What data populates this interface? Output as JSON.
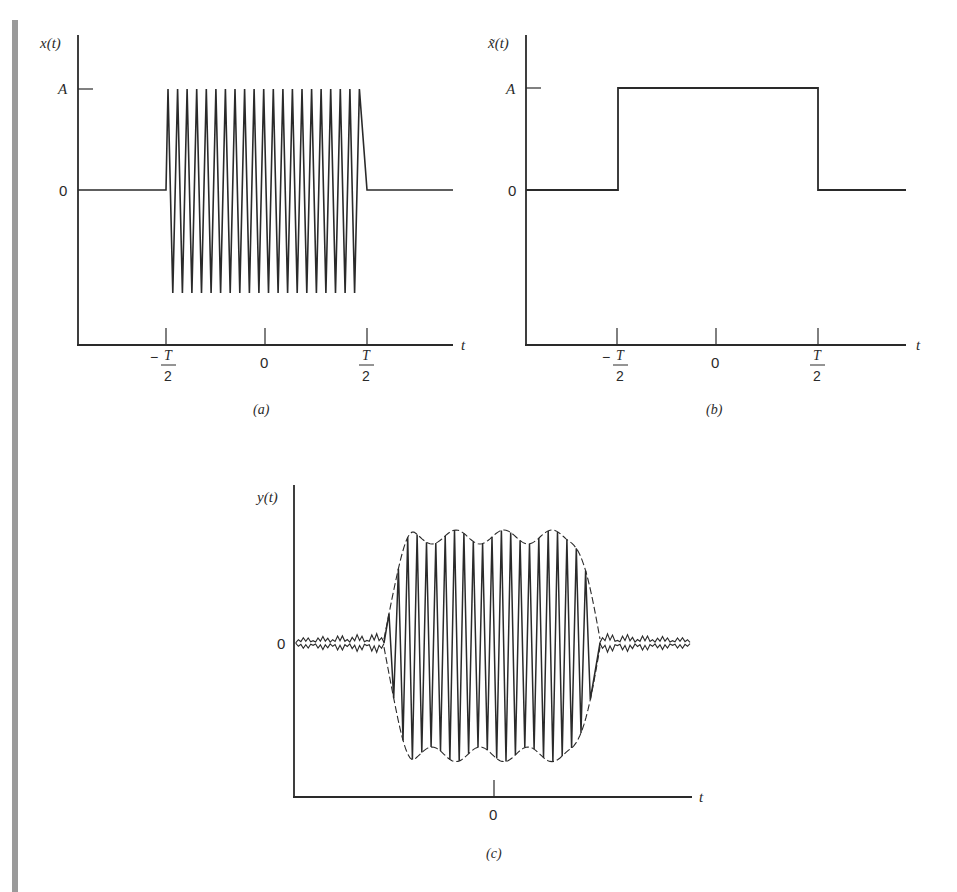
{
  "figure": {
    "margin_bar_color": "#9a9a9a",
    "ink_color": "#2a2a2a",
    "panels": {
      "a": {
        "caption": "(a)",
        "ylabel": "x(t)",
        "xlabel": "t",
        "ytick_top": "A",
        "ytick_zero": "0",
        "xticks": [
          "−T/2",
          "0",
          "T/2"
        ]
      },
      "b": {
        "caption": "(b)",
        "ylabel": "x̃(t)",
        "xlabel": "t",
        "ytick_top": "A",
        "ytick_zero": "0",
        "xticks": [
          "−T/2",
          "0",
          "T/2"
        ]
      },
      "c": {
        "caption": "(c)",
        "ylabel": "y(t)",
        "xlabel": "t",
        "ytick_zero": "0",
        "xticks": [
          "0"
        ]
      }
    }
  },
  "chart_data": [
    {
      "id": "a",
      "type": "line",
      "title": "(a)",
      "xlabel": "t",
      "ylabel": "x(t)",
      "description": "Sinusoidal pulse: oscillation of amplitude A between t = -T/2 and t = T/2, zero elsewhere",
      "x_tick_labels": [
        "-T/2",
        "0",
        "T/2"
      ],
      "y_tick_labels": [
        "0",
        "A"
      ],
      "oscillation_cycles_visible": 21,
      "amplitude": "A",
      "support": [
        "-T/2",
        "T/2"
      ],
      "grid": false
    },
    {
      "id": "b",
      "type": "line",
      "title": "(b)",
      "xlabel": "t",
      "ylabel": "x̃(t)",
      "description": "Rectangular envelope: value A on [-T/2, T/2], zero elsewhere",
      "x_tick_labels": [
        "-T/2",
        "0",
        "T/2"
      ],
      "y_tick_labels": [
        "0",
        "A"
      ],
      "x": [
        "-inf",
        "-T/2",
        "-T/2",
        "T/2",
        "T/2",
        "inf"
      ],
      "y": [
        0,
        0,
        "A",
        "A",
        0,
        0
      ],
      "grid": false
    },
    {
      "id": "c",
      "type": "line",
      "title": "(c)",
      "xlabel": "t",
      "ylabel": "y(t)",
      "description": "Filtered output: oscillation with rippled (Gibbs-like) dashed envelope, overshoot near pulse edges, small residual ringing outside the pulse",
      "x_tick_labels": [
        "0"
      ],
      "y_tick_labels": [
        "0"
      ],
      "envelope_style": "dashed",
      "envelope_ripples": 4,
      "grid": false
    }
  ]
}
